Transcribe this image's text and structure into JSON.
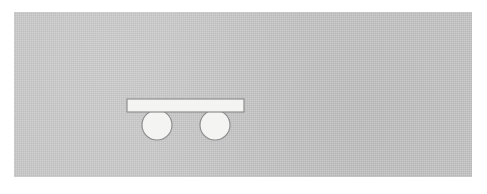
{
  "document": {
    "title": "Mechanics figure: rigid bar supported by two circular rollers",
    "kind": "line-diagram",
    "background_color": "#ffffff"
  },
  "panel": {
    "name": "diagram-panel",
    "fill_color": "#c9c9c9",
    "texture": "subtle-noise",
    "x": 14,
    "y": 12,
    "width": 458,
    "height": 165
  },
  "figure": {
    "name": "bar-on-two-rollers",
    "stroke_color": "#8c8c8c",
    "fill_color": "#f4f4f3",
    "stroke_width": 1.15,
    "bar": {
      "label": "bar",
      "x": 127,
      "y": 99,
      "width": 117,
      "height": 13
    },
    "rollers": [
      {
        "label": "left-roller",
        "cx": 157,
        "cy": 125,
        "r": 15
      },
      {
        "label": "right-roller",
        "cx": 215,
        "cy": 125,
        "r": 15
      }
    ]
  },
  "annotations": {
    "text_items": [],
    "note": "no visible text, labels, axes or legend in the image"
  }
}
